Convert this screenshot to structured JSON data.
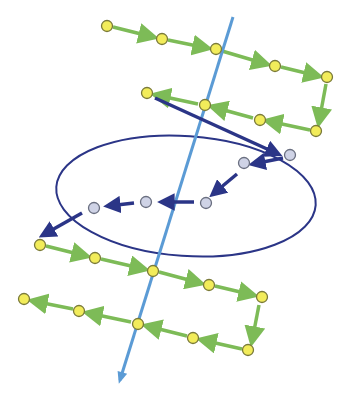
{
  "colors": {
    "background": "#ffffff",
    "axis_line": "#5b9bd5",
    "ellipse": "#2b3587",
    "green_arrow": "#7dbb57",
    "yellow_node_fill": "#f2ec5a",
    "yellow_node_stroke": "#7a7a3a",
    "grey_node_fill": "#cfd3e6",
    "grey_node_stroke": "#6a6f80",
    "dark_arrow": "#2b3587"
  },
  "axis": {
    "x1": 233,
    "y1": 17,
    "x2": 120,
    "y2": 380
  },
  "ellipse": {
    "cx": 186,
    "cy": 196,
    "rx": 130,
    "ry": 60,
    "rotate": 4
  },
  "yellow_nodes": [
    [
      107,
      26
    ],
    [
      162,
      39
    ],
    [
      216,
      49
    ],
    [
      275,
      66
    ],
    [
      327,
      77
    ],
    [
      316,
      131
    ],
    [
      260,
      120
    ],
    [
      205,
      105
    ],
    [
      147,
      93
    ],
    [
      40,
      245
    ],
    [
      95,
      258
    ],
    [
      153,
      271
    ],
    [
      209,
      285
    ],
    [
      262,
      297
    ],
    [
      248,
      350
    ],
    [
      193,
      338
    ],
    [
      138,
      324
    ],
    [
      79,
      311
    ],
    [
      24,
      299
    ]
  ],
  "green_arrows": [
    [
      113,
      27,
      153,
      37
    ],
    [
      168,
      40,
      207,
      48
    ],
    [
      222,
      51,
      266,
      64
    ],
    [
      281,
      67,
      318,
      76
    ],
    [
      326,
      84,
      319,
      122
    ],
    [
      310,
      130,
      268,
      121
    ],
    [
      253,
      118,
      213,
      107
    ],
    [
      198,
      104,
      156,
      95
    ],
    [
      46,
      246,
      86,
      256
    ],
    [
      101,
      259,
      144,
      269
    ],
    [
      159,
      272,
      200,
      283
    ],
    [
      215,
      286,
      253,
      295
    ],
    [
      259,
      305,
      252,
      341
    ],
    [
      242,
      349,
      202,
      340
    ],
    [
      187,
      336,
      147,
      326
    ],
    [
      131,
      322,
      88,
      313
    ],
    [
      73,
      309,
      33,
      301
    ]
  ],
  "grey_nodes": [
    [
      290,
      155
    ],
    [
      244,
      163
    ],
    [
      206,
      203
    ],
    [
      146,
      202
    ],
    [
      94,
      208
    ]
  ],
  "dark_arrows": [
    {
      "line": [
        155,
        98,
        278,
        154
      ],
      "width": 3.5
    },
    {
      "line": [
        283,
        158,
        253,
        164
      ],
      "width": 3.5
    },
    {
      "line": [
        237,
        174,
        213,
        194
      ],
      "width": 3.5
    },
    {
      "line": [
        194,
        202,
        162,
        202
      ],
      "width": 3.5
    },
    {
      "line": [
        134,
        203,
        108,
        206
      ],
      "width": 3.5
    },
    {
      "line": [
        82,
        213,
        43,
        235
      ],
      "width": 3.5
    }
  ]
}
